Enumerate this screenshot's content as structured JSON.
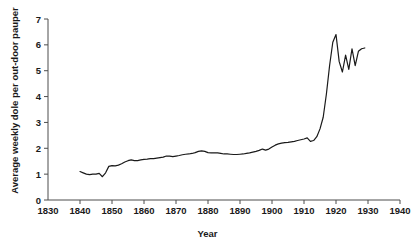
{
  "chart_data": {
    "type": "line",
    "title": "",
    "xlabel": "Year",
    "ylabel": "Average weekly dole per out-door pauper",
    "xlim": [
      1830,
      1940
    ],
    "ylim": [
      0,
      7
    ],
    "xticks": [
      1830,
      1840,
      1850,
      1860,
      1870,
      1880,
      1890,
      1900,
      1910,
      1920,
      1930,
      1940
    ],
    "yticks": [
      0,
      1,
      2,
      3,
      4,
      5,
      6,
      7
    ],
    "grid": false,
    "legend": null,
    "line_color": "#1a1a1a",
    "series": [
      {
        "name": "Average weekly dole per out-door pauper",
        "x": [
          1840,
          1841,
          1842,
          1843,
          1844,
          1845,
          1846,
          1847,
          1848,
          1849,
          1850,
          1851,
          1852,
          1853,
          1854,
          1855,
          1856,
          1857,
          1858,
          1859,
          1860,
          1861,
          1862,
          1863,
          1864,
          1865,
          1866,
          1867,
          1868,
          1869,
          1870,
          1871,
          1872,
          1873,
          1874,
          1875,
          1876,
          1877,
          1878,
          1879,
          1880,
          1881,
          1882,
          1883,
          1884,
          1885,
          1886,
          1887,
          1888,
          1889,
          1890,
          1891,
          1892,
          1893,
          1894,
          1895,
          1896,
          1897,
          1898,
          1899,
          1900,
          1901,
          1902,
          1903,
          1904,
          1905,
          1906,
          1907,
          1908,
          1909,
          1910,
          1911,
          1912,
          1913,
          1914,
          1915,
          1916,
          1917,
          1918,
          1919,
          1920,
          1921,
          1922,
          1923,
          1924,
          1925,
          1926,
          1927,
          1928,
          1929
        ],
        "values": [
          1.1,
          1.05,
          1.0,
          0.98,
          1.0,
          1.0,
          1.03,
          0.9,
          1.05,
          1.3,
          1.33,
          1.32,
          1.35,
          1.4,
          1.47,
          1.52,
          1.55,
          1.52,
          1.52,
          1.55,
          1.57,
          1.58,
          1.6,
          1.6,
          1.62,
          1.64,
          1.66,
          1.7,
          1.7,
          1.68,
          1.7,
          1.72,
          1.75,
          1.77,
          1.78,
          1.8,
          1.83,
          1.88,
          1.9,
          1.88,
          1.83,
          1.82,
          1.82,
          1.82,
          1.8,
          1.78,
          1.78,
          1.77,
          1.76,
          1.76,
          1.77,
          1.78,
          1.8,
          1.82,
          1.85,
          1.88,
          1.92,
          1.97,
          1.93,
          1.97,
          2.05,
          2.12,
          2.17,
          2.2,
          2.22,
          2.23,
          2.25,
          2.27,
          2.3,
          2.33,
          2.36,
          2.4,
          2.27,
          2.3,
          2.45,
          2.75,
          3.2,
          4.1,
          5.2,
          6.1,
          6.4,
          5.35,
          4.95,
          5.6,
          5.05,
          5.85,
          5.2,
          5.75,
          5.85,
          5.88
        ]
      }
    ]
  }
}
